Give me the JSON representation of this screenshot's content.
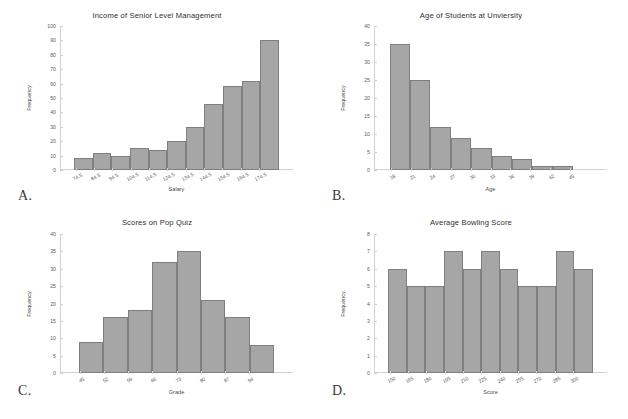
{
  "figure": {
    "background": "#ffffff",
    "bar_fill": "#a6a6a6",
    "bar_edge": "#7f7f7f"
  },
  "panels": [
    {
      "letter": "A.",
      "chart_data": {
        "type": "bar",
        "title": "Income of Senior Level Management",
        "xlabel": "Salary",
        "ylabel": "Frequency",
        "categories": [
          "74.5",
          "84.5",
          "94.5",
          "104.5",
          "114.5",
          "124.5",
          "134.5",
          "144.5",
          "154.5",
          "164.5",
          "174.5"
        ],
        "values": [
          8,
          12,
          10,
          15,
          14,
          20,
          30,
          46,
          58,
          62,
          90
        ],
        "ylim": [
          0,
          100
        ],
        "yticks": [
          0,
          10,
          20,
          30,
          40,
          50,
          60,
          70,
          80,
          90,
          100
        ],
        "grid": false,
        "legend": "none",
        "shape": "skewed left"
      }
    },
    {
      "letter": "B.",
      "chart_data": {
        "type": "bar",
        "title": "Age of Students at Unviersity",
        "xlabel": "Age",
        "ylabel": "Frequency",
        "categories": [
          "18",
          "21",
          "24",
          "27",
          "30",
          "33",
          "36",
          "39",
          "42",
          "45"
        ],
        "values": [
          35,
          25,
          12,
          9,
          6,
          4,
          3,
          1,
          1,
          0
        ],
        "ylim": [
          0,
          40
        ],
        "yticks": [
          0,
          5,
          10,
          15,
          20,
          25,
          30,
          35,
          40
        ],
        "grid": false,
        "legend": "none",
        "shape": "skewed right"
      }
    },
    {
      "letter": "C.",
      "chart_data": {
        "type": "bar",
        "title": "Scores on Pop Quiz",
        "xlabel": "Grade",
        "ylabel": "Frequency",
        "categories": [
          "45",
          "52",
          "59",
          "66",
          "73",
          "80",
          "87",
          "94"
        ],
        "values": [
          9,
          16,
          18,
          32,
          35,
          21,
          16,
          8
        ],
        "ylim": [
          0,
          40
        ],
        "yticks": [
          0,
          5,
          10,
          15,
          20,
          25,
          30,
          35,
          40
        ],
        "grid": false,
        "legend": "none",
        "shape": "symmetric bell"
      }
    },
    {
      "letter": "D.",
      "chart_data": {
        "type": "bar",
        "title": "Average Bowling Score",
        "xlabel": "Score",
        "ylabel": "Frequency",
        "categories": [
          "150",
          "165",
          "180",
          "195",
          "210",
          "225",
          "240",
          "255",
          "270",
          "285",
          "300"
        ],
        "values": [
          6,
          5,
          5,
          7,
          6,
          7,
          6,
          5,
          5,
          7,
          6
        ],
        "ylim": [
          0,
          8
        ],
        "yticks": [
          0,
          1,
          2,
          3,
          4,
          5,
          6,
          7,
          8
        ],
        "grid": false,
        "legend": "none",
        "shape": "uniform"
      }
    }
  ]
}
